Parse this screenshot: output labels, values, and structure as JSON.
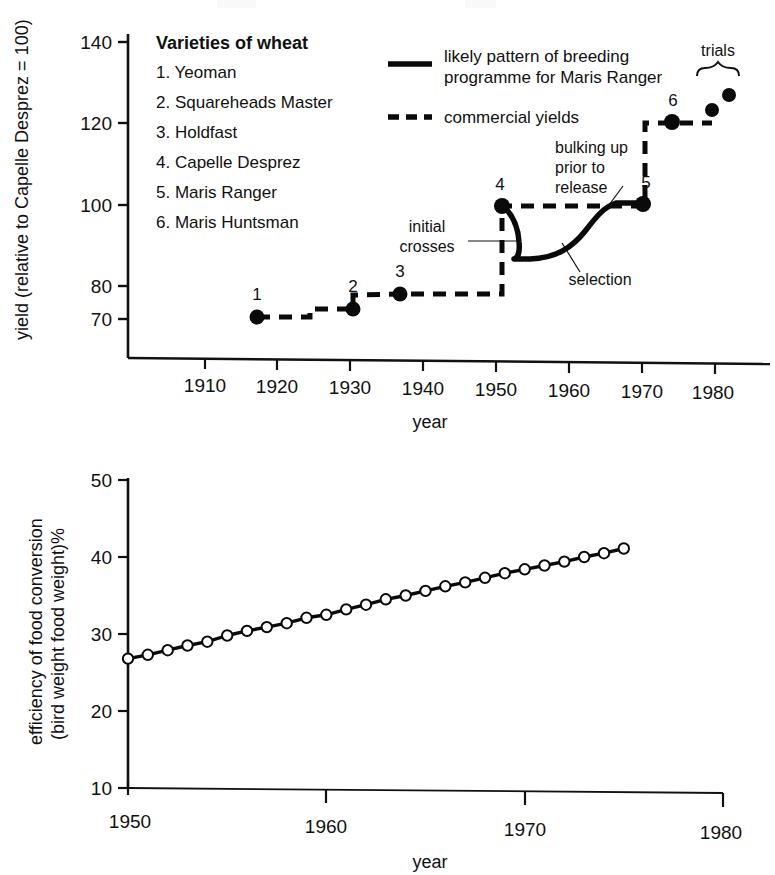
{
  "figure": {
    "panels": [
      "wheat-yield-chart",
      "food-conversion-chart"
    ]
  },
  "chart_data": [
    {
      "type": "line",
      "id": "wheat-yield-chart",
      "title": "",
      "xlabel": "year",
      "ylabel": "yield (relative to Capelle Desprez = 100)",
      "xlim": [
        1903,
        1981
      ],
      "ylim": [
        62,
        145
      ],
      "grid": false,
      "xticks": [
        1910,
        1920,
        1930,
        1940,
        1950,
        1960,
        1970,
        1980
      ],
      "xticklabels": [
        "1910",
        "1920",
        "1930",
        "1940",
        "1950",
        "1960",
        "1970",
        "1980"
      ],
      "yticks": [
        70,
        80,
        100,
        120,
        140
      ],
      "yticklabels": [
        "70",
        "80",
        "100",
        "120",
        "140"
      ],
      "legend_position": "upper-center",
      "legend": [
        {
          "key": "solid",
          "label_line1": "likely pattern of breeding",
          "label_line2": "programme for Maris Ranger"
        },
        {
          "key": "dashed",
          "label_line1": "commercial yields",
          "label_line2": ""
        }
      ],
      "varieties_title": "Varieties of wheat",
      "varieties": [
        "1. Yeoman",
        "2. Squareheads Master",
        "3. Holdfast",
        "4. Capelle Desprez",
        "5. Maris Ranger",
        "6. Maris Huntsman"
      ],
      "series": [
        {
          "name": "commercial yields",
          "style": "dashed",
          "points": [
            {
              "x": 1917,
              "y": 71.5,
              "label": "1",
              "marker": "filled"
            },
            {
              "x": 1930,
              "y": 73.5,
              "label": "2",
              "marker": "filled"
            },
            {
              "x": 1936,
              "y": 77.0,
              "label": "3",
              "marker": "filled"
            },
            {
              "x": 1953,
              "y": 100.0,
              "label": "4",
              "marker": "filled"
            },
            {
              "x": 1970,
              "y": 100.5,
              "label": "5",
              "marker": "filled"
            },
            {
              "x": 1972.5,
              "y": 120.0,
              "label": "6",
              "marker": "filled"
            },
            {
              "x": 1977.5,
              "y": 122.5,
              "label": "",
              "marker": "filled"
            },
            {
              "x": 1979.5,
              "y": 127.5,
              "label": "",
              "marker": "filled"
            }
          ]
        },
        {
          "name": "likely pattern of breeding programme for Maris Ranger",
          "style": "solid",
          "description": "initial crosses at 1953 drop to ~85, selection rises through 1964 to a bulking-up plateau at ~102 ending at Maris Ranger (5) in 1970"
        }
      ],
      "annotations": [
        {
          "text": "initial crosses",
          "lines": [
            "initial",
            "crosses"
          ]
        },
        {
          "text": "bulking up prior to release",
          "lines": [
            "bulking up",
            "prior to",
            "release"
          ]
        },
        {
          "text": "selection",
          "lines": [
            "selection"
          ]
        },
        {
          "text": "trials",
          "lines": [
            "trials"
          ]
        }
      ]
    },
    {
      "type": "line",
      "id": "food-conversion-chart",
      "title": "",
      "xlabel": "year",
      "ylabel_line1": "efficiency of food conversion",
      "ylabel_line2": "(bird weight food weight)%",
      "xlim": [
        1950,
        1980
      ],
      "ylim": [
        10,
        50
      ],
      "grid": false,
      "xticks": [
        1950,
        1960,
        1970,
        1980
      ],
      "xticklabels": [
        "1950",
        "1960",
        "1970",
        "1980"
      ],
      "yticks": [
        10,
        20,
        30,
        40,
        50
      ],
      "yticklabels": [
        "10",
        "20",
        "30",
        "40",
        "50"
      ],
      "marker": "open-circle",
      "x": [
        1950,
        1951,
        1952,
        1953,
        1954,
        1955,
        1956,
        1957,
        1958,
        1959,
        1960,
        1961,
        1962,
        1963,
        1964,
        1965,
        1966,
        1967,
        1968,
        1969,
        1970,
        1971,
        1972,
        1973,
        1974,
        1975
      ],
      "values": [
        26.8,
        27.3,
        27.9,
        28.5,
        29.0,
        29.8,
        30.4,
        30.9,
        31.4,
        32.1,
        32.5,
        33.2,
        33.8,
        34.5,
        35.0,
        35.6,
        36.2,
        36.7,
        37.3,
        37.9,
        38.4,
        38.9,
        39.4,
        40.0,
        40.5,
        41.1
      ]
    }
  ]
}
